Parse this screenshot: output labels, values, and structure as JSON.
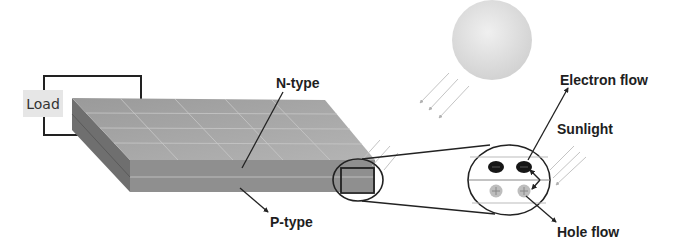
{
  "diagram": {
    "type": "solar-cell-schematic",
    "labels": {
      "load": "Load",
      "n_type": "N-type",
      "p_type": "P-type",
      "electron_flow": "Electron flow",
      "sunlight": "Sunlight",
      "hole_flow": "Hole flow"
    },
    "components": [
      {
        "name": "sun",
        "shape": "sphere"
      },
      {
        "name": "solar-panel",
        "layers": [
          "N-type",
          "P-type"
        ]
      },
      {
        "name": "load",
        "connection": "wire circuit to panel"
      },
      {
        "name": "magnified-view",
        "electrons": 2,
        "holes": 2
      }
    ],
    "colors": {
      "panel_top": "#a4a4a4",
      "panel_front": "#8e8e8e",
      "panel_side": "#6e6e6e",
      "sun": "#e2e2e2",
      "electron": "#1a1a1a",
      "hole": "#b8b8b8",
      "line": "#222222"
    }
  }
}
